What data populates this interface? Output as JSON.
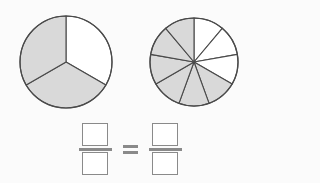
{
  "page": {
    "background_color": "#fbfbfb"
  },
  "style": {
    "shaded_color": "#d9d9d9",
    "unshaded_color": "#ffffff",
    "stroke_color": "#4a4a4a",
    "box_border_color": "#8a8a8a",
    "bar_color": "#8a8a8a"
  },
  "models": [
    {
      "id": "left-pie",
      "name": "three-part-circle",
      "total_parts": 3,
      "shaded_parts": 2,
      "fraction_text": "2/3",
      "start_angle_deg": 0,
      "radius": 46,
      "center_x": 48,
      "center_y": 48,
      "shaded_indices": [
        1,
        2
      ]
    },
    {
      "id": "right-pie",
      "name": "nine-part-circle",
      "total_parts": 9,
      "shaded_parts": 6,
      "fraction_text": "6/9",
      "start_angle_deg": 0,
      "radius": 44,
      "center_x": 46,
      "center_y": 46,
      "shaded_indices": [
        3,
        4,
        5,
        6,
        7,
        8
      ]
    }
  ],
  "equation": {
    "left_fraction": {
      "numerator": "",
      "denominator": "",
      "numerator_placeholder": "",
      "denominator_placeholder": ""
    },
    "operator": "=",
    "right_fraction": {
      "numerator": "",
      "denominator": "",
      "numerator_placeholder": "",
      "denominator_placeholder": ""
    }
  },
  "chart_data": {
    "type": "pie",
    "charts": [
      {
        "name": "left-pie",
        "slices": 3,
        "labels": [
          "part 1",
          "part 2",
          "part 3"
        ],
        "values": [
          1,
          1,
          1
        ],
        "shaded": [
          false,
          true,
          true
        ],
        "fraction": "2/3"
      },
      {
        "name": "right-pie",
        "slices": 9,
        "labels": [
          "part 1",
          "part 2",
          "part 3",
          "part 4",
          "part 5",
          "part 6",
          "part 7",
          "part 8",
          "part 9"
        ],
        "values": [
          1,
          1,
          1,
          1,
          1,
          1,
          1,
          1,
          1
        ],
        "shaded": [
          false,
          false,
          false,
          true,
          true,
          true,
          true,
          true,
          true
        ],
        "fraction": "6/9"
      }
    ],
    "legend": [],
    "grid": false
  }
}
